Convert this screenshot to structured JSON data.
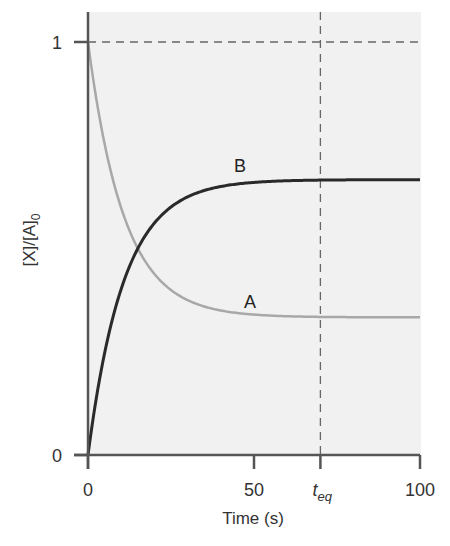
{
  "chart_data": {
    "type": "line",
    "title": "",
    "xlabel": "Time (s)",
    "ylabel": "[X]/[A]0",
    "ylabel_main": "[X]/[A]",
    "ylabel_sub": "0",
    "xlim": [
      0,
      100
    ],
    "ylim": [
      0,
      1
    ],
    "grid": false,
    "legend": "inline labels",
    "x_ticks": [
      {
        "value": 0,
        "label": "0"
      },
      {
        "value": 50,
        "label": "50"
      },
      {
        "value": 70,
        "label": "t",
        "sub": "eq"
      },
      {
        "value": 100,
        "label": "100"
      }
    ],
    "y_ticks": [
      {
        "value": 0,
        "label": "0"
      },
      {
        "value": 1,
        "label": "1"
      }
    ],
    "reference_lines": [
      {
        "orientation": "horizontal",
        "y": 1,
        "style": "dashed"
      },
      {
        "orientation": "vertical",
        "x": 70,
        "style": "dashed",
        "label": "t_eq"
      }
    ],
    "series": [
      {
        "name": "A",
        "color": "#a8a8a8",
        "model": "1/3 + 2/3*exp(-0.0924*t)",
        "x": [
          0,
          5,
          10,
          15,
          20,
          25,
          30,
          40,
          50,
          60,
          70,
          80,
          90,
          100
        ],
        "values": [
          1.0,
          0.754,
          0.6,
          0.5,
          0.438,
          0.4,
          0.375,
          0.35,
          0.34,
          0.336,
          0.334,
          0.334,
          0.333,
          0.333
        ],
        "label_position": {
          "x": 50,
          "y": 0.37
        }
      },
      {
        "name": "B",
        "color": "#2a2a2a",
        "model": "2/3*(1-exp(-0.0924*t))",
        "x": [
          0,
          5,
          10,
          15,
          20,
          25,
          30,
          40,
          50,
          60,
          70,
          80,
          90,
          100
        ],
        "values": [
          0.0,
          0.246,
          0.4,
          0.5,
          0.562,
          0.6,
          0.625,
          0.65,
          0.66,
          0.664,
          0.666,
          0.666,
          0.667,
          0.667
        ],
        "label_position": {
          "x": 47,
          "y": 0.7
        }
      }
    ]
  }
}
